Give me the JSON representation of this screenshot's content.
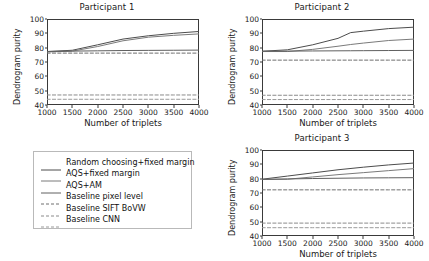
{
  "figure": {
    "axis_labels": {
      "x": "Number of triplets",
      "y": "Dendrogram purity"
    }
  },
  "legend": {
    "entries": [
      {
        "label": "Random choosing+fixed margin",
        "style": "solid",
        "color": "#4c4c4c"
      },
      {
        "label": "AQS+fixed margin",
        "style": "solid",
        "color": "#7a7a7a"
      },
      {
        "label": "AQS+AM",
        "style": "solid",
        "color": "#606060"
      },
      {
        "label": "Baseline pixel level",
        "style": "dashed",
        "color": "#6e6e6e"
      },
      {
        "label": "Baseline SIFT BoVW",
        "style": "dashed",
        "color": "#8a8a8a"
      },
      {
        "label": "Baseline CNN",
        "style": "dashed",
        "color": "#9a9a9a"
      }
    ]
  },
  "chart_data": [
    {
      "type": "line",
      "title": "Participant 1",
      "xlabel": "Number of triplets",
      "ylabel": "Dendrogram purity",
      "xlim": [
        1000,
        4000
      ],
      "ylim": [
        40,
        100
      ],
      "xticks": [
        1000,
        1500,
        2000,
        2500,
        3000,
        3500,
        4000
      ],
      "yticks": [
        40,
        50,
        60,
        70,
        80,
        90,
        100
      ],
      "grid": false,
      "x": [
        1000,
        1500,
        2000,
        2500,
        3000,
        3500,
        4000
      ],
      "series": [
        {
          "name": "Random choosing+fixed margin",
          "style": "solid",
          "color": "#4c4c4c",
          "values": [
            77.3,
            78.2,
            82.0,
            86.0,
            88.3,
            90.0,
            91.3
          ]
        },
        {
          "name": "AQS+fixed margin",
          "style": "solid",
          "color": "#7a7a7a",
          "values": [
            77.0,
            77.6,
            80.8,
            84.8,
            87.3,
            88.6,
            89.6
          ]
        },
        {
          "name": "AQS+AM",
          "style": "solid",
          "color": "#606060",
          "values": [
            77.3,
            77.6,
            77.8,
            78.0,
            78.1,
            78.2,
            78.3
          ]
        },
        {
          "name": "Baseline pixel level",
          "style": "dashed",
          "color": "#6e6e6e",
          "values": [
            76.2,
            76.2,
            76.2,
            76.2,
            76.2,
            76.2,
            76.2
          ]
        },
        {
          "name": "Baseline SIFT BoVW",
          "style": "dashed",
          "color": "#8a8a8a",
          "values": [
            47.0,
            47.0,
            47.0,
            47.0,
            47.0,
            47.0,
            47.0
          ]
        },
        {
          "name": "Baseline CNN",
          "style": "dashed",
          "color": "#9a9a9a",
          "values": [
            44.0,
            44.0,
            44.0,
            44.0,
            44.0,
            44.0,
            44.0
          ]
        }
      ]
    },
    {
      "type": "line",
      "title": "Participant 2",
      "xlabel": "Number of triplets",
      "ylabel": "Dendrogram purity",
      "xlim": [
        1000,
        4000
      ],
      "ylim": [
        40,
        100
      ],
      "xticks": [
        1000,
        1500,
        2000,
        2500,
        3000,
        3500,
        4000
      ],
      "yticks": [
        40,
        50,
        60,
        70,
        80,
        90,
        100
      ],
      "grid": false,
      "x": [
        1000,
        1500,
        2000,
        2500,
        2750,
        3000,
        3500,
        4000
      ],
      "series": [
        {
          "name": "Random choosing+fixed margin",
          "style": "solid",
          "color": "#4c4c4c",
          "values": [
            77.5,
            78.5,
            82.0,
            86.5,
            90.5,
            91.5,
            93.3,
            94.3
          ]
        },
        {
          "name": "AQS+fixed margin",
          "style": "solid",
          "color": "#7a7a7a",
          "values": [
            77.3,
            77.3,
            78.8,
            81.0,
            82.2,
            83.2,
            85.0,
            86.0
          ]
        },
        {
          "name": "AQS+AM",
          "style": "solid",
          "color": "#606060",
          "values": [
            77.5,
            77.6,
            77.7,
            77.8,
            77.85,
            77.9,
            78.0,
            78.1
          ]
        },
        {
          "name": "Baseline pixel level",
          "style": "dashed",
          "color": "#6e6e6e",
          "values": [
            71.3,
            71.3,
            71.3,
            71.3,
            71.3,
            71.3,
            71.3,
            71.3
          ]
        },
        {
          "name": "Baseline SIFT BoVW",
          "style": "dashed",
          "color": "#8a8a8a",
          "values": [
            46.8,
            46.8,
            46.8,
            46.8,
            46.8,
            46.8,
            46.8,
            46.8
          ]
        },
        {
          "name": "Baseline CNN",
          "style": "dashed",
          "color": "#9a9a9a",
          "values": [
            43.8,
            43.8,
            43.8,
            43.8,
            43.8,
            43.8,
            43.8,
            43.8
          ]
        }
      ]
    },
    {
      "type": "line",
      "title": "Participant 3",
      "xlabel": "Number of triplets",
      "ylabel": "Dendrogram purity",
      "xlim": [
        1000,
        4000
      ],
      "ylim": [
        40,
        100
      ],
      "xticks": [
        1000,
        1500,
        2000,
        2500,
        3000,
        3500,
        4000
      ],
      "yticks": [
        40,
        50,
        60,
        70,
        80,
        90,
        100
      ],
      "grid": false,
      "x": [
        1000,
        1500,
        2000,
        2500,
        3000,
        3500,
        4000
      ],
      "series": [
        {
          "name": "Random choosing+fixed margin",
          "style": "solid",
          "color": "#4c4c4c",
          "values": [
            79.6,
            81.8,
            84.0,
            86.2,
            88.0,
            89.6,
            90.9
          ]
        },
        {
          "name": "AQS+fixed margin",
          "style": "solid",
          "color": "#7a7a7a",
          "values": [
            79.5,
            79.6,
            81.2,
            82.8,
            84.2,
            85.6,
            87.0
          ]
        },
        {
          "name": "AQS+AM",
          "style": "solid",
          "color": "#606060",
          "values": [
            79.5,
            79.8,
            80.1,
            80.3,
            80.5,
            80.6,
            80.7
          ]
        },
        {
          "name": "Baseline pixel level",
          "style": "dashed",
          "color": "#6e6e6e",
          "values": [
            72.2,
            72.2,
            72.2,
            72.2,
            72.2,
            72.2,
            72.2
          ]
        },
        {
          "name": "Baseline SIFT BoVW",
          "style": "dashed",
          "color": "#8a8a8a",
          "values": [
            49.0,
            49.0,
            49.0,
            49.0,
            49.0,
            49.0,
            49.0
          ]
        },
        {
          "name": "Baseline CNN",
          "style": "dashed",
          "color": "#9a9a9a",
          "values": [
            45.8,
            45.8,
            45.8,
            45.8,
            45.8,
            45.8,
            45.8
          ]
        }
      ]
    }
  ]
}
